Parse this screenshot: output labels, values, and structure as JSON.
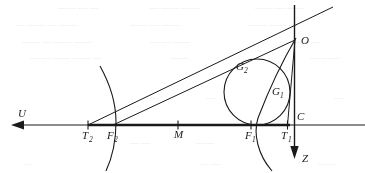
{
  "figure": {
    "stroke_color": "#1a1a1a",
    "background_color": "#ffffff",
    "ghost_text_color": "#e2e2e2"
  },
  "labels": {
    "u_axis": "U",
    "z_axis": "Z",
    "point_o": "O",
    "point_c": "C",
    "point_m": "M",
    "tangent_g1_base": "G",
    "tangent_g1_sub": "1",
    "tangent_g2_base": "G",
    "tangent_g2_sub": "2",
    "focus_f1_base": "F",
    "focus_f1_sub": "1",
    "focus_f2_base": "F",
    "focus_f2_sub": "2",
    "vertex_t1_base": "T",
    "vertex_t1_sub": "1",
    "vertex_t2_base": "T",
    "vertex_t2_sub": "2"
  },
  "geometry": {
    "axis_y": 125,
    "axis_x_left": 12,
    "axis_x_right": 365,
    "u_arrow_tip_x": 12,
    "vertical_line_x": 294.5,
    "vertical_line_top_y": 5,
    "z_arrow_tip_y": 158,
    "point_o": {
      "x": 295,
      "y": 40
    },
    "point_t2": {
      "x": 88,
      "y": 125
    },
    "point_f2": {
      "x": 113,
      "y": 125
    },
    "point_m": {
      "x": 178,
      "y": 125
    },
    "point_f1": {
      "x": 251,
      "y": 125
    },
    "point_t1": {
      "x": 287,
      "y": 125
    },
    "point_g2": {
      "x": 231,
      "y": 64
    },
    "point_g1": {
      "x": 287,
      "y": 97
    },
    "circle": {
      "cx": 257,
      "cy": 92,
      "r": 33
    },
    "ray_top_right_end": {
      "x": 333,
      "y": 7
    },
    "left_arc": {
      "top_x": 100,
      "top_y": 66,
      "apex_x": 116,
      "apex_y": 122,
      "bottom_x": 106,
      "bottom_y": 171
    },
    "right_arc": {
      "top_x": 296,
      "top_y": 38,
      "apex_x": 258,
      "apex_y": 118,
      "bottom_x": 272,
      "bottom_y": 171
    }
  },
  "background_noise": {
    "note": "faint show-through text from reverse side of page",
    "rows": [
      {
        "y": 10,
        "items": [
          {
            "x": 58,
            "t": "—— —"
          },
          {
            "x": 110,
            "t": "— ——"
          },
          {
            "x": 168,
            "t": "——"
          },
          {
            "x": 214,
            "t": "— ——"
          },
          {
            "x": 276,
            "t": "——"
          },
          {
            "x": 322,
            "t": "— —"
          }
        ]
      },
      {
        "y": 27,
        "items": [
          {
            "x": 16,
            "t": "—"
          },
          {
            "x": 44,
            "t": "—— —"
          },
          {
            "x": 96,
            "t": "——"
          },
          {
            "x": 140,
            "t": "——"
          },
          {
            "x": 198,
            "t": "— —"
          },
          {
            "x": 248,
            "t": "——"
          },
          {
            "x": 306,
            "t": "—— —"
          }
        ]
      },
      {
        "y": 44,
        "items": [
          {
            "x": 22,
            "t": "——"
          },
          {
            "x": 66,
            "t": "— ——"
          },
          {
            "x": 124,
            "t": "——"
          },
          {
            "x": 172,
            "t": "— —"
          },
          {
            "x": 226,
            "t": "——"
          },
          {
            "x": 330,
            "t": "— —"
          }
        ]
      },
      {
        "y": 60,
        "items": [
          {
            "x": 30,
            "t": "— —"
          },
          {
            "x": 78,
            "t": "——"
          },
          {
            "x": 128,
            "t": "—— —"
          },
          {
            "x": 190,
            "t": "——"
          },
          {
            "x": 318,
            "t": "— ——"
          }
        ]
      },
      {
        "y": 100,
        "items": [
          {
            "x": 150,
            "t": "—"
          },
          {
            "x": 206,
            "t": "—"
          },
          {
            "x": 334,
            "t": "—"
          }
        ]
      },
      {
        "y": 145,
        "items": [
          {
            "x": 130,
            "t": "— —"
          },
          {
            "x": 196,
            "t": "——"
          },
          {
            "x": 332,
            "t": "—"
          }
        ]
      },
      {
        "y": 166,
        "items": [
          {
            "x": 24,
            "t": "—"
          },
          {
            "x": 200,
            "t": "— —"
          },
          {
            "x": 318,
            "t": "——"
          }
        ]
      }
    ]
  }
}
